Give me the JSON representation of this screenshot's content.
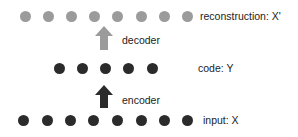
{
  "diagram": {
    "layers": [
      {
        "id": "reconstruction",
        "label": "reconstruction: X'",
        "nodes": 8,
        "color": "#9b9b9b"
      },
      {
        "id": "code",
        "label": "code: Y",
        "nodes": 5,
        "color": "#2b2b2b"
      },
      {
        "id": "input",
        "label": "input: X",
        "nodes": 8,
        "color": "#2b2b2b"
      }
    ],
    "edges": [
      {
        "from": "code",
        "to": "reconstruction",
        "label": "decoder",
        "color": "#9b9b9b"
      },
      {
        "from": "input",
        "to": "code",
        "label": "encoder",
        "color": "#2b2b2b"
      }
    ]
  },
  "labels": {
    "reconstruction": "reconstruction: X'",
    "decoder": "decoder",
    "code": "code: Y",
    "encoder": "encoder",
    "input": "input: X"
  }
}
